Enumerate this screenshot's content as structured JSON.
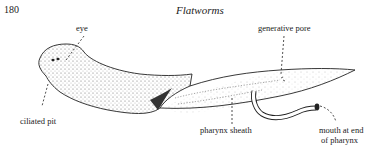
{
  "page": {
    "number": "180",
    "title": "Flatworms"
  },
  "figure": {
    "labels": {
      "eye": "eye",
      "generative_pore": "generative pore",
      "ciliated_pit": "ciliated pit",
      "pharynx_sheath": "pharynx sheath",
      "mouth_line1": "mouth at end",
      "mouth_line2": "of pharynx"
    }
  }
}
